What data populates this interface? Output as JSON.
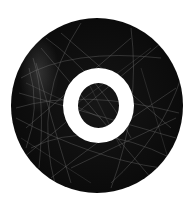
{
  "logo": {
    "letter": "O",
    "colors": {
      "background": "#ffffff",
      "circle": "#0b0b0b",
      "letter": "#ffffff",
      "scratches": "#9a9a9a"
    }
  }
}
